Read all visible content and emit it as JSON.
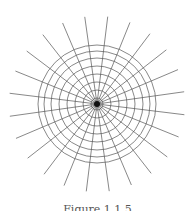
{
  "diagram": {
    "type": "polar-grid",
    "center": [
      97,
      104
    ],
    "radial_lines": {
      "count": 24,
      "start_angle_deg": 7,
      "length": 88,
      "inner_radius": 2,
      "color": "#555555",
      "width": 0.7
    },
    "circles": {
      "radii": [
        6,
        14,
        22,
        30,
        38,
        46,
        53,
        59
      ],
      "color": "#555555",
      "width": 0.7
    },
    "hub": {
      "radius": 3,
      "color": "#111111"
    }
  },
  "caption": {
    "text": "Figure 1.1.5"
  }
}
